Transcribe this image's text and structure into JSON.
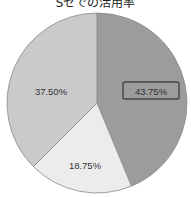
{
  "chart_data": {
    "type": "pie",
    "title": "Sセでの活用率",
    "categories": [
      "slice-1",
      "slice-2",
      "slice-3"
    ],
    "values": [
      43.75,
      18.75,
      37.5
    ],
    "labels": [
      "43.75%",
      "18.75%",
      "37.50%"
    ],
    "colors": [
      "#9c9c9c",
      "#ececec",
      "#cacaca"
    ],
    "start_angle": "12 o'clock, clockwise",
    "highlighted_label": "43.75%",
    "legend": "none"
  }
}
